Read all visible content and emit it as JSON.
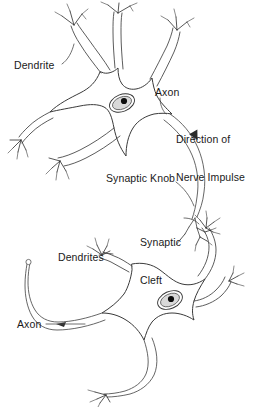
{
  "figure": {
    "background_color": "#ffffff",
    "ink_color": "#2b2b2b",
    "width": 257,
    "height": 407
  },
  "labels": {
    "dendrite_upper": "Dendrite",
    "axon_upper": "Axon",
    "direction_line1": "Direction of",
    "direction_line2": "Nerve Impulse",
    "synaptic_knob": "Synaptic Knob",
    "synaptic_cleft_line1": "Synaptic",
    "synaptic_cleft_line2": "Cleft",
    "dendrites_lower": "Dendrites",
    "axon_lower": "Axon"
  },
  "structures": {
    "upper_neuron": "presynaptic neuron",
    "lower_neuron": "postsynaptic neuron",
    "nucleus": "nucleus",
    "nucleolus": "nucleolus",
    "cell_body": "soma"
  }
}
